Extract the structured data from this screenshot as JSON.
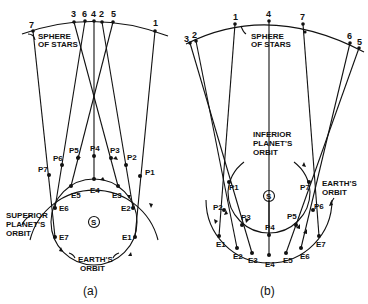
{
  "figure": {
    "panel_a": {
      "caption": "(a)",
      "sphere_label": [
        "SPHERE",
        "OF STARS"
      ],
      "planet_orbit_label": [
        "SUPERIOR",
        "PLANET'S",
        "ORBIT"
      ],
      "earth_orbit_label": [
        "EARTH'S",
        "ORBIT"
      ],
      "sun_label": "S",
      "star_labels": [
        "7",
        "3",
        "6",
        "4",
        "2",
        "5",
        "1"
      ],
      "planet_labels": [
        "P1",
        "P2",
        "P3",
        "P4",
        "P5",
        "P6",
        "P7"
      ],
      "earth_labels": [
        "E1",
        "E2",
        "E3",
        "E4",
        "E5",
        "E6",
        "E7"
      ]
    },
    "panel_b": {
      "caption": "(b)",
      "sphere_label": [
        "SPHERE",
        "OF STARS"
      ],
      "planet_orbit_label": [
        "INFERIOR",
        "PLANET'S",
        "ORBIT"
      ],
      "earth_orbit_label": [
        "EARTH'S",
        "ORBIT"
      ],
      "sun_label": "S",
      "star_labels": [
        "3",
        "2",
        "1",
        "4",
        "7",
        "6",
        "5"
      ],
      "planet_labels": [
        "P1",
        "P2",
        "P3",
        "P4",
        "P5",
        "P6",
        "P7"
      ],
      "earth_labels": [
        "E1",
        "E2",
        "E3",
        "E4",
        "E5",
        "E6",
        "E7"
      ]
    }
  }
}
